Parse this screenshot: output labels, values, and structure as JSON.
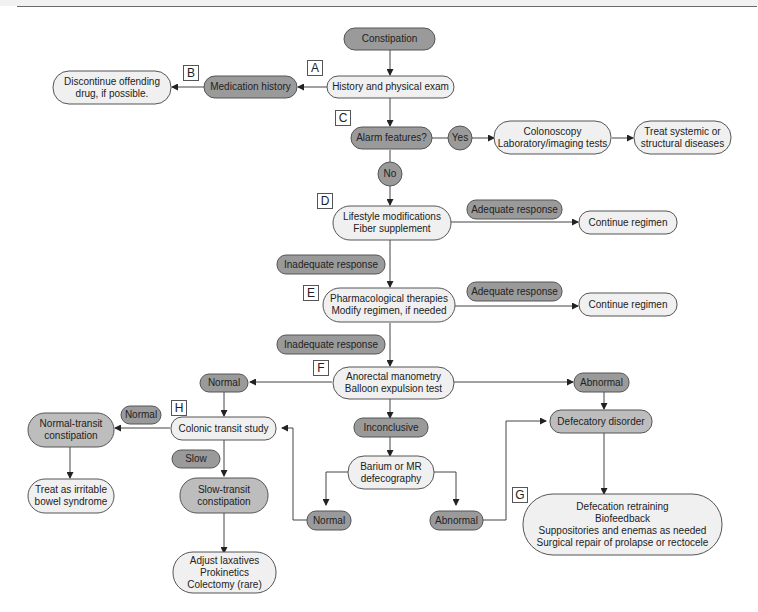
{
  "figure": {
    "title_rule": true,
    "colors": {
      "dark_node": "#9a9a9a",
      "light_node": "#f0f0f0",
      "mid_node": "#bdbdbd",
      "stroke": "#555555"
    },
    "step_tags": [
      "A",
      "B",
      "C",
      "D",
      "E",
      "F",
      "G",
      "H"
    ],
    "nodes": {
      "constipation": "Constipation",
      "history_exam": "History and physical exam",
      "medication_history": "Medication history",
      "discontinue_drug": "Discontinue offending\ndrug, if possible.",
      "alarm_features": "Alarm features?",
      "yes": "Yes",
      "no": "No",
      "colonoscopy": "Colonoscopy\nLaboratory/imaging tests",
      "treat_systemic": "Treat systemic or\nstructural diseases",
      "lifestyle": "Lifestyle modifications\nFiber supplement",
      "adequate_1": "Adequate response",
      "continue_1": "Continue regimen",
      "inadequate_1": "Inadequate response",
      "pharmacological": "Pharmacological therapies\nModify regimen, if needed",
      "adequate_2": "Adequate response",
      "continue_2": "Continue regimen",
      "inadequate_2": "Inadequate response",
      "anorectal": "Anorectal manometry\nBalloon expulsion test",
      "normal_f": "Normal",
      "abnormal_f": "Abnormal",
      "inconclusive": "Inconclusive",
      "colonic_transit": "Colonic transit study",
      "normal_h": "Normal",
      "slow": "Slow",
      "normal_transit": "Normal-transit\nconstipation",
      "treat_ibs": "Treat as irritable\nbowel syndrome",
      "slow_transit": "Slow-transit\nconstipation",
      "adjust_laxatives": "Adjust laxatives\nProkinetics\nColectomy (rare)",
      "barium": "Barium or MR\ndefecography",
      "normal_def": "Normal",
      "abnormal_def": "Abnormal",
      "defecatory_disorder": "Defecatory disorder",
      "defecation_retraining": "Defecation retraining\nBiofeedback\nSuppositories and enemas as needed\nSurgical repair of prolapse or rectocele"
    }
  }
}
